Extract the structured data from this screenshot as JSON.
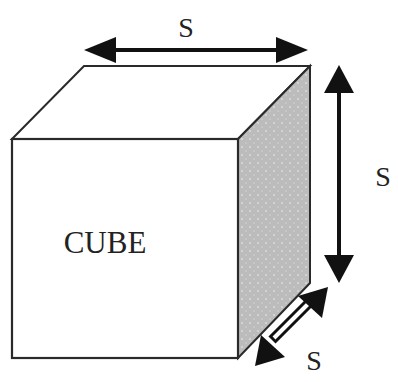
{
  "diagram": {
    "shape": "cube",
    "center_label": "CUBE",
    "dimension_labels": {
      "width": "S",
      "height": "S",
      "depth": "S"
    },
    "colors": {
      "stroke": "#2a2a2a",
      "side_face": "#bdbdbd",
      "front_face": "#ffffff",
      "arrow": "#111111"
    }
  }
}
